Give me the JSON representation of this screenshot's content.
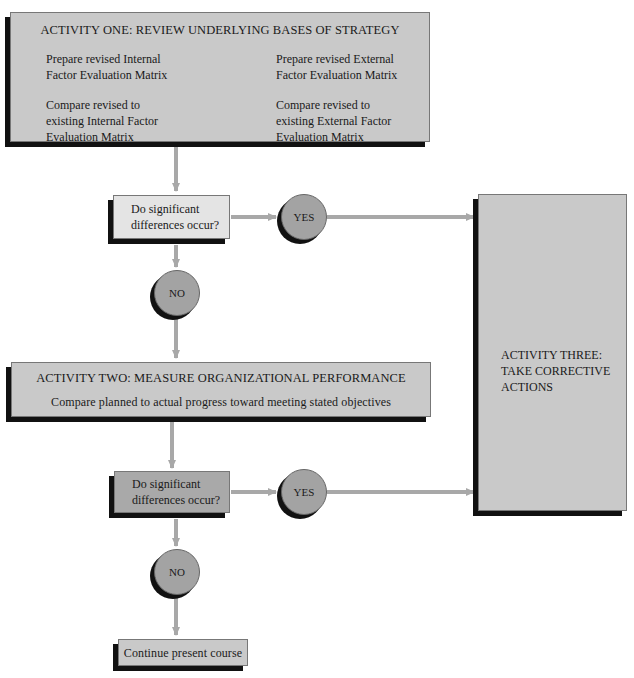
{
  "activity_one": {
    "title": "ACTIVITY ONE: REVIEW UNDERLYING BASES OF STRATEGY",
    "items": [
      {
        "line1": "Prepare revised Internal",
        "line2": "Factor Evaluation Matrix"
      },
      {
        "line1": "Prepare revised External",
        "line2": "Factor Evaluation Matrix"
      },
      {
        "line1": "Compare revised to",
        "line2": "existing Internal Factor",
        "line3": "Evaluation Matrix"
      },
      {
        "line1": "Compare revised to",
        "line2": "existing External Factor",
        "line3": "Evaluation Matrix"
      }
    ]
  },
  "decision_one": {
    "line1": "Do significant",
    "line2": "differences occur?"
  },
  "yes_one": "YES",
  "no_one": "NO",
  "activity_two": {
    "title": "ACTIVITY TWO: MEASURE ORGANIZATIONAL PERFORMANCE",
    "text": "Compare planned to actual progress toward meeting stated objectives"
  },
  "decision_two": {
    "line1": "Do significant",
    "line2": "differences occur?"
  },
  "yes_two": "YES",
  "no_two": "NO",
  "activity_three": {
    "line1": "ACTIVITY THREE:",
    "line2": "TAKE CORRECTIVE",
    "line3": "ACTIONS"
  },
  "continue": "Continue present course",
  "colors": {
    "arrow": "#a8a8a8",
    "shadow": "#111111",
    "circle": "#a3a3a3"
  }
}
